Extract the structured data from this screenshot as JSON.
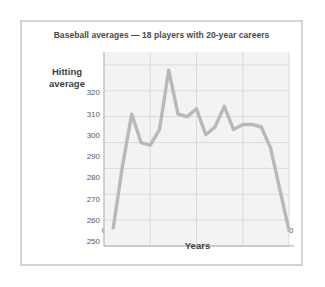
{
  "chart_data": {
    "type": "line",
    "title": "Baseball averages — 18 players with 20-year careers",
    "xlabel": "Years",
    "ylabel": "Hitting average",
    "ylabel_line1": "Hitting",
    "ylabel_line2": "average",
    "x": [
      1,
      2,
      3,
      4,
      5,
      6,
      7,
      8,
      9,
      10,
      11,
      12,
      13,
      14,
      15,
      16,
      17,
      18,
      19,
      20
    ],
    "values": [
      257,
      281,
      301,
      290,
      289,
      295,
      318,
      301,
      300,
      303,
      293,
      296,
      304,
      295,
      297,
      297,
      296,
      288,
      272,
      256
    ],
    "series": [
      {
        "name": "Hitting average",
        "values": [
          257,
          281,
          301,
          290,
          289,
          295,
          318,
          301,
          300,
          303,
          293,
          296,
          304,
          295,
          297,
          297,
          296,
          288,
          272,
          256
        ]
      }
    ],
    "xlim": [
      0,
      20
    ],
    "ylim": [
      250,
      325
    ],
    "ytick_labels": [
      "250",
      "260",
      "270",
      "280",
      "290",
      "300",
      "310",
      "320"
    ],
    "ytick_values": [
      250,
      260,
      270,
      280,
      290,
      300,
      310,
      320
    ],
    "xtick_labels": [
      "0",
      "5",
      "10",
      "15",
      "20"
    ],
    "xtick_values": [
      0,
      5,
      10,
      15,
      20
    ],
    "grid": true,
    "legend": "none",
    "line_color": "#b9b9b9",
    "plot_background": "#f3f3f3",
    "grid_color": "#d8d8d8",
    "frame_color": "#d3d3d3",
    "axis_color": "#aeaeae"
  }
}
